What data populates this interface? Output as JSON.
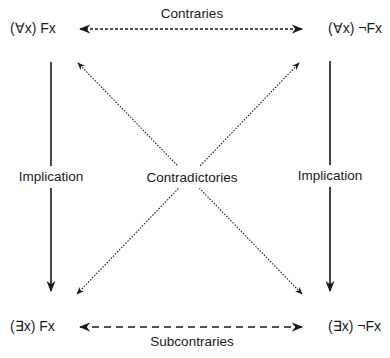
{
  "nodes": {
    "top_left": {
      "quant": "(∀x) F",
      "var": "x",
      "neg": ""
    },
    "top_right": {
      "quant": "(∀x) ¬F",
      "var": "x",
      "neg": ""
    },
    "bottom_left": {
      "quant": "(∃x) F",
      "var": "x",
      "neg": ""
    },
    "bottom_right": {
      "quant": "(∃x) ¬F",
      "var": "x",
      "neg": ""
    }
  },
  "text": {
    "top_left": "(∀x) Fx",
    "top_right": "(∀x) ¬Fx",
    "bottom_left": "(∃x) Fx",
    "bottom_right": "(∃x) ¬Fx"
  },
  "labels": {
    "contraries": "Contraries",
    "subcontraries": "Subcontraries",
    "implication_left": "Implication",
    "implication_right": "Implication",
    "contradictories": "Contradictories"
  },
  "colors": {
    "line": "#1a1a1a"
  }
}
